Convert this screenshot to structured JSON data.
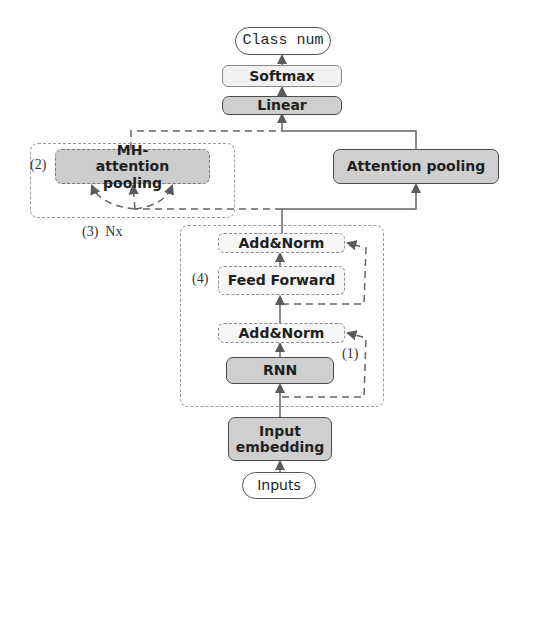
{
  "diagram": {
    "title": "",
    "nodes": {
      "class_num": "Class num",
      "softmax": "Softmax",
      "linear": "Linear",
      "mh_attention_pooling": "MH-attention pooling",
      "attention_pooling": "Attention pooling",
      "add_norm_top": "Add&Norm",
      "feed_forward": "Feed Forward",
      "add_norm_bottom": "Add&Norm",
      "rnn": "RNN",
      "input_embedding": "Input embedding",
      "inputs": "Inputs"
    },
    "labels": {
      "mh_marker": "(2)",
      "repeat_marker": "(3)  Nx",
      "ff_marker": "(4)",
      "residual_marker": "(1)"
    },
    "colors": {
      "dark_box": "#cfcfcf",
      "light_box": "#f1f1f1",
      "line": "#666666"
    },
    "edges": [
      {
        "from": "inputs",
        "to": "input_embedding",
        "style": "solid"
      },
      {
        "from": "input_embedding",
        "to": "rnn",
        "style": "solid"
      },
      {
        "from": "rnn",
        "to": "add_norm_bottom",
        "style": "solid"
      },
      {
        "from": "input_embedding",
        "to": "add_norm_bottom",
        "style": "dashed",
        "note": "residual (1)"
      },
      {
        "from": "add_norm_bottom",
        "to": "feed_forward",
        "style": "solid"
      },
      {
        "from": "feed_forward",
        "to": "add_norm_top",
        "style": "solid"
      },
      {
        "from": "add_norm_bottom",
        "to": "add_norm_top",
        "style": "dashed",
        "note": "residual"
      },
      {
        "from": "add_norm_top",
        "to": "attention_pooling",
        "style": "solid"
      },
      {
        "from": "add_norm_top",
        "to": "mh_attention_pooling",
        "style": "dashed"
      },
      {
        "from": "attention_pooling",
        "to": "linear",
        "style": "solid"
      },
      {
        "from": "mh_attention_pooling",
        "to": "linear",
        "style": "dashed"
      },
      {
        "from": "linear",
        "to": "softmax",
        "style": "solid"
      },
      {
        "from": "softmax",
        "to": "class_num",
        "style": "solid"
      }
    ]
  }
}
